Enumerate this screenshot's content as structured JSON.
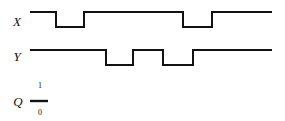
{
  "figure": {
    "title": "",
    "background_color": "#ffffff",
    "stroke_color": "#121212",
    "width": 285,
    "height": 121
  },
  "signals": {
    "x": {
      "label": "X",
      "label_x": 17,
      "label_y": 26,
      "high_y": 12,
      "low_y": 27,
      "start_x": 30,
      "end_x": 272,
      "initial_level": "high",
      "path": "M30,12 L56,12 L56,27 L84,27 L84,12 L183,12 L183,27 L212,27 L212,12 L272,12"
    },
    "y": {
      "label": "Y",
      "label_x": 17,
      "label_y": 61,
      "high_y": 50,
      "low_y": 65,
      "start_x": 30,
      "end_x": 272,
      "initial_level": "high",
      "path": "M30,50 L106,50 L106,65 L133,65 L133,50 L163,50 L163,65 L193,65 L193,50 L272,50"
    },
    "q": {
      "label": "Q",
      "label_x": 18,
      "label_y": 106,
      "high_label": "1",
      "high_label_x": 40,
      "high_label_y": 88,
      "low_label": "0",
      "low_label_x": 40,
      "low_label_y": 115,
      "segment_x1": 30,
      "segment_x2": 48,
      "segment_y": 101
    }
  },
  "chart_data": {
    "type": "line",
    "title": "",
    "xlabel": "",
    "ylabel": "",
    "legend_position": "left-axis-labels",
    "grid": false,
    "xlim": [
      30,
      272
    ],
    "ylim": [
      0,
      1
    ],
    "series": [
      {
        "name": "X",
        "type": "digital",
        "levels": [
          "1",
          "0"
        ],
        "transitions": [
          {
            "x": 30,
            "level": 1
          },
          {
            "x": 56,
            "level": 0
          },
          {
            "x": 84,
            "level": 1
          },
          {
            "x": 183,
            "level": 0
          },
          {
            "x": 212,
            "level": 1
          },
          {
            "x": 272,
            "level": 1
          }
        ]
      },
      {
        "name": "Y",
        "type": "digital",
        "levels": [
          "1",
          "0"
        ],
        "transitions": [
          {
            "x": 30,
            "level": 1
          },
          {
            "x": 106,
            "level": 0
          },
          {
            "x": 133,
            "level": 1
          },
          {
            "x": 163,
            "level": 0
          },
          {
            "x": 193,
            "level": 1
          },
          {
            "x": 272,
            "level": 1
          }
        ]
      },
      {
        "name": "Q",
        "type": "digital",
        "levels": [
          "1",
          "0"
        ],
        "transitions": [
          {
            "x": 30,
            "level": 0
          },
          {
            "x": 48,
            "level": 0
          }
        ]
      }
    ]
  }
}
